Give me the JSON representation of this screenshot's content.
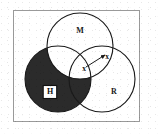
{
  "figure": {
    "background_color": "#ffffff",
    "frame": {
      "border_color": "#9a9a9a",
      "fill_color": "#ffffff"
    },
    "shading_color": "#2b2b2b",
    "outline_color": "#1a1a1a",
    "circles": [
      {
        "id": "circle-m",
        "label": "M",
        "position": "top",
        "shaded": false,
        "cx": 80,
        "cy": 46,
        "r": 33
      },
      {
        "id": "circle-h",
        "label": "H",
        "position": "lower-left",
        "shaded": true,
        "cx": 58,
        "cy": 79,
        "r": 33
      },
      {
        "id": "circle-r",
        "label": "R",
        "position": "lower-right",
        "shaded": false,
        "cx": 102,
        "cy": 79,
        "r": 33
      }
    ],
    "boxed_label": {
      "text": "H",
      "box_fill": "#ffffff",
      "box_border": "#111111",
      "x": 50,
      "y": 92
    },
    "labels": [
      {
        "id": "label-m",
        "text": "M",
        "x": 80,
        "y": 31
      },
      {
        "id": "label-r",
        "text": "R",
        "x": 114,
        "y": 92
      }
    ],
    "x_marks": [
      {
        "id": "x-mark-center",
        "text": "x",
        "x": 84,
        "y": 69
      },
      {
        "id": "x-mark-upper-right",
        "text": "x",
        "x": 107,
        "y": 57
      }
    ],
    "arrow": {
      "from_x": 86,
      "from_y": 67,
      "to_x": 105,
      "to_y": 55,
      "color": "#1a1a1a",
      "head": "arrowhead"
    }
  }
}
